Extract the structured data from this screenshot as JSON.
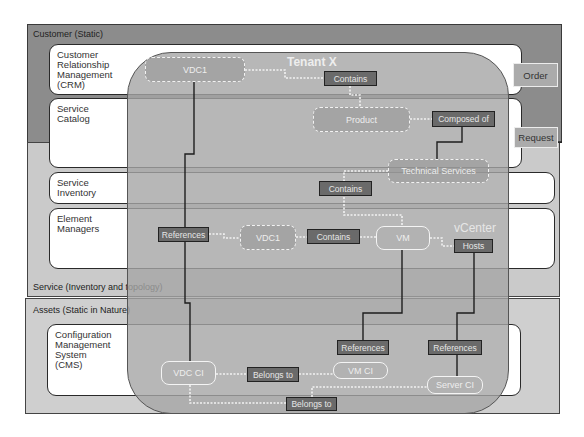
{
  "layers": {
    "customer": "Customer (Static)",
    "service": "Service (Inventory and topology)",
    "assets": "Assets (Static in Nature)"
  },
  "systems": {
    "crm": "Customer\nRelationship\nManagement\n(CRM)",
    "service_catalog": "Service\nCatalog",
    "service_inventory": "Service\nInventory",
    "element_managers": "Element\nManagers",
    "cms": "Configuration\nManagement\nSystem\n(CMS)"
  },
  "side_actions": {
    "order": "Order",
    "request": "Request"
  },
  "tenant": {
    "title": "Tenant X",
    "vcenter": "vCenter"
  },
  "nodes": {
    "vdc1_top": "VDC1",
    "product": "Product",
    "technical_services": "Technical Services",
    "vdc1_mid": "VDC1",
    "vm": "VM",
    "vdc_ci": "VDC CI",
    "vm_ci": "VM CI",
    "server_ci": "Server CI"
  },
  "relations": {
    "contains_top": "Contains",
    "composed_of": "Composed of",
    "contains_mid": "Contains",
    "contains_vm": "Contains",
    "references_left": "References",
    "hosts": "Hosts",
    "references_vm": "References",
    "references_server": "References",
    "belongs_to_mid": "Belongs to",
    "belongs_to_bottom": "Belongs to"
  }
}
